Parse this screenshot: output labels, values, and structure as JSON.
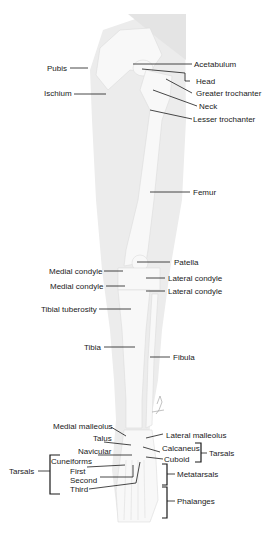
{
  "diagram": {
    "labels": {
      "pubis": "Pubis",
      "ischium": "Ischium",
      "acetabulum": "Acetabulum",
      "head": "Head",
      "greater_trochanter": "Greater trochanter",
      "neck": "Neck",
      "lesser_trochanter": "Lesser trochanter",
      "femur": "Femur",
      "patella": "Patella",
      "medial_condyle_femur": "Medial condyle",
      "lateral_condyle_femur": "Lateral condyle",
      "medial_condyle_tibia": "Medial condyle",
      "lateral_condyle_tibia": "Lateral condyle",
      "tibial_tuberosity": "Tibial tuberosity",
      "tibia": "Tibia",
      "fibula": "Fibula",
      "medial_malleolus": "Medial malleolus",
      "lateral_malleolus": "Lateral malleolus",
      "talus": "Talus",
      "calcaneus": "Calcaneus",
      "navicular": "Navicular",
      "cuboid": "Cuboid",
      "tarsals_right": "Tarsals",
      "cuneiforms": "Cuneiforms",
      "first": "First",
      "second": "Second",
      "third": "Third",
      "tarsals_left": "Tarsals",
      "metatarsals": "Metatarsals",
      "phalanges": "Phalanges"
    },
    "colors": {
      "silhouette": "#ececec",
      "bone": "#f7f7f7",
      "text": "#1a1a1a"
    }
  }
}
